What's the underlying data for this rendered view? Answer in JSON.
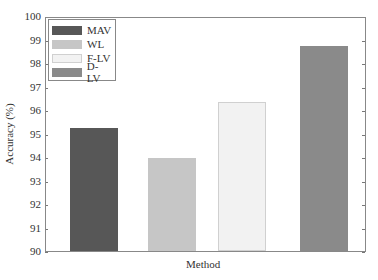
{
  "chart_data": {
    "type": "bar",
    "title": "",
    "xlabel": "Method",
    "ylabel": "Accuracy (%)",
    "ylim": [
      90,
      100
    ],
    "yticks": [
      90,
      91,
      92,
      93,
      94,
      95,
      96,
      97,
      98,
      99,
      100
    ],
    "categories": [
      "MAV",
      "WL",
      "F-LV",
      "D-LV"
    ],
    "values": [
      95.3,
      94.0,
      96.4,
      98.8
    ],
    "colors": [
      "#575757",
      "#c6c6c6",
      "#f2f2f2",
      "#8a8a8a"
    ],
    "legend": {
      "position": "upper left",
      "entries": [
        "MAV",
        "WL",
        "F-LV",
        "D-LV"
      ]
    },
    "grid": false
  }
}
